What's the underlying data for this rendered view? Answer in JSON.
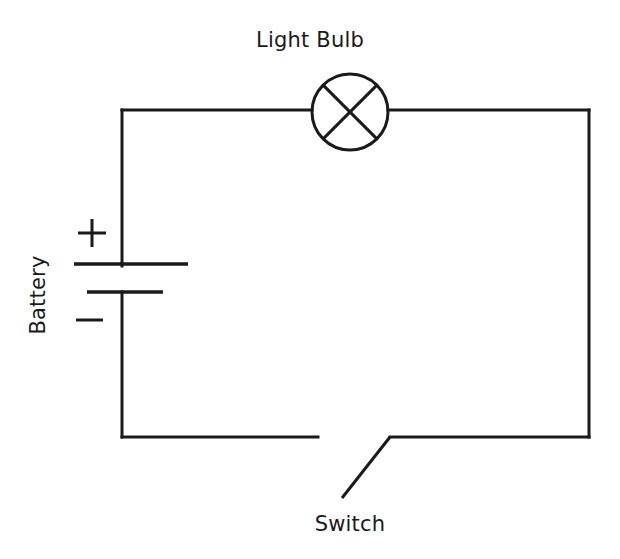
{
  "diagram": {
    "background_color": "#ffffff",
    "line_color": "#1a1a1a",
    "labels": {
      "light_bulb": "Light Bulb",
      "battery": "Battery",
      "switch": "Switch",
      "plus": "+",
      "minus": "−"
    },
    "components": [
      {
        "name": "light-bulb",
        "label": "Light Bulb",
        "symbol": "circle-with-x",
        "center_x": 350,
        "center_y": 112,
        "radius": 38
      },
      {
        "name": "battery",
        "label": "Battery",
        "symbol": "two-cell-plates",
        "positive_plate": {
          "x1": 74,
          "x2": 188,
          "y": 264
        },
        "negative_plate": {
          "x1": 87,
          "x2": 163,
          "y": 292
        },
        "positive_marker": {
          "x": 92,
          "y": 233
        },
        "negative_marker": {
          "x": 89,
          "y": 320
        }
      },
      {
        "name": "switch",
        "label": "Switch",
        "symbol": "open-knife-switch",
        "state": "open",
        "left_terminal": {
          "x": 318,
          "y": 437
        },
        "pivot": {
          "x": 342,
          "y": 498
        },
        "right_terminal": {
          "x": 390,
          "y": 437
        }
      }
    ],
    "wires": {
      "top": {
        "y": 110,
        "x1": 122,
        "x2": 589
      },
      "left_upper": {
        "x": 122,
        "y1": 110,
        "y2": 264
      },
      "left_lower": {
        "x": 122,
        "y1": 292,
        "y2": 437
      },
      "bottom_left": {
        "y": 437,
        "x1": 122,
        "x2": 318
      },
      "bottom_right": {
        "y": 437,
        "x1": 390,
        "x2": 589
      },
      "right": {
        "x": 589,
        "y1": 110,
        "y2": 437
      },
      "bulb_lead_left": {
        "y": 110,
        "x1": 122,
        "x2": 312
      },
      "bulb_lead_right": {
        "y": 110,
        "x1": 388,
        "x2": 589
      }
    }
  }
}
